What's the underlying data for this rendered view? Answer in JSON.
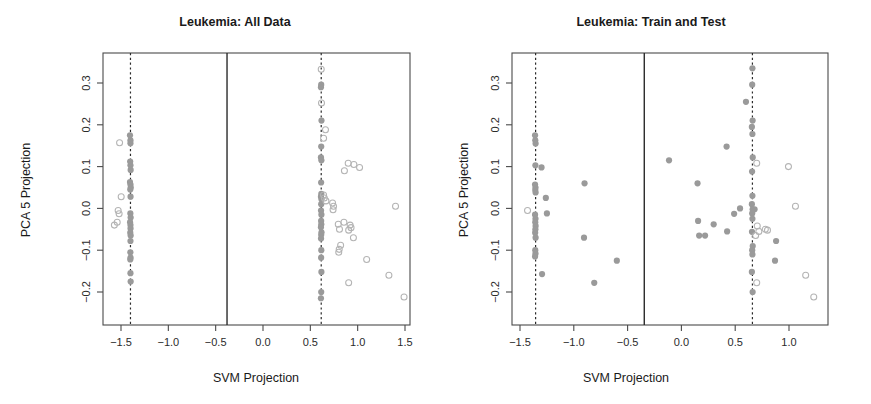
{
  "figure": {
    "width": 871,
    "height": 404,
    "background": "#ffffff",
    "panel_count": 2
  },
  "colors": {
    "filled_point": "#9a9a9a",
    "open_point": "#b4b4b4",
    "axis": "#4a4a4a",
    "rule": "#2b2b2b",
    "text": "#1a1a1a"
  },
  "chart_data": [
    {
      "type": "scatter",
      "panel": "left",
      "title": "Leukemia: All Data",
      "xlabel": "SVM Projection",
      "ylabel": "PCA 5 Projection",
      "xlim": [
        -1.7,
        1.62
      ],
      "ylim": [
        -0.235,
        0.345
      ],
      "xticks": [
        -1.5,
        -1.0,
        -0.5,
        0.0,
        0.5,
        1.0,
        1.5
      ],
      "xticklabels": [
        "-1.5",
        "-1.0",
        "-0.5",
        "0.0",
        "0.5",
        "1.0",
        "1.5"
      ],
      "yticks": [
        0.3,
        0.2,
        0.1,
        0.0,
        -0.1,
        -0.2
      ],
      "yticklabels": [
        "0.3",
        "0.2",
        "0.1",
        "0.0",
        "-0.1",
        "-0.2"
      ],
      "grid": false,
      "legend": "none",
      "vlines": [
        {
          "x": -1.4,
          "style": "dashed",
          "label": "negative-margin"
        },
        {
          "x": -0.38,
          "style": "solid",
          "label": "decision-boundary"
        },
        {
          "x": 0.615,
          "style": "dashed",
          "label": "positive-margin"
        }
      ],
      "series": [
        {
          "name": "support-vectors",
          "marker": "filled-circle",
          "color": "#9a9a9a",
          "points": [
            [
              -1.405,
              0.175
            ],
            [
              -1.4,
              0.163
            ],
            [
              -1.4,
              0.156
            ],
            [
              -1.403,
              0.112
            ],
            [
              -1.4,
              0.103
            ],
            [
              -1.398,
              0.092
            ],
            [
              -1.405,
              0.063
            ],
            [
              -1.4,
              0.057
            ],
            [
              -1.397,
              0.05
            ],
            [
              -1.402,
              0.045
            ],
            [
              -1.399,
              0.028
            ],
            [
              -1.401,
              -0.012
            ],
            [
              -1.398,
              -0.022
            ],
            [
              -1.404,
              -0.033
            ],
            [
              -1.4,
              -0.04
            ],
            [
              -1.399,
              -0.048
            ],
            [
              -1.402,
              -0.058
            ],
            [
              -1.398,
              -0.065
            ],
            [
              -1.4,
              -0.078
            ],
            [
              -1.401,
              -0.105
            ],
            [
              -1.399,
              -0.118
            ],
            [
              -1.402,
              -0.122
            ],
            [
              -1.4,
              -0.155
            ],
            [
              -1.398,
              -0.175
            ],
            [
              0.615,
              0.296
            ],
            [
              0.612,
              0.29
            ],
            [
              0.618,
              0.21
            ],
            [
              0.615,
              0.148
            ],
            [
              0.612,
              0.122
            ],
            [
              0.617,
              0.115
            ],
            [
              0.614,
              0.062
            ],
            [
              0.616,
              0.035
            ],
            [
              0.612,
              0.028
            ],
            [
              0.618,
              0.022
            ],
            [
              0.615,
              0.01
            ],
            [
              0.613,
              -0.005
            ],
            [
              0.617,
              -0.015
            ],
            [
              0.614,
              -0.03
            ],
            [
              0.616,
              -0.038
            ],
            [
              0.612,
              -0.045
            ],
            [
              0.618,
              -0.057
            ],
            [
              0.615,
              -0.063
            ],
            [
              0.613,
              -0.072
            ],
            [
              0.616,
              -0.1
            ],
            [
              0.614,
              -0.118
            ],
            [
              0.617,
              -0.152
            ],
            [
              0.615,
              -0.2
            ],
            [
              0.612,
              -0.215
            ]
          ]
        },
        {
          "name": "non-support-vectors",
          "marker": "open-circle",
          "color": "#b4b4b4",
          "points": [
            [
              -1.515,
              0.157
            ],
            [
              -1.53,
              -0.005
            ],
            [
              -1.52,
              -0.013
            ],
            [
              -1.54,
              -0.033
            ],
            [
              -1.57,
              -0.04
            ],
            [
              -1.498,
              0.028
            ],
            [
              0.615,
              0.333
            ],
            [
              0.618,
              0.252
            ],
            [
              0.66,
              0.188
            ],
            [
              0.64,
              0.168
            ],
            [
              0.64,
              0.032
            ],
            [
              0.648,
              0.025
            ],
            [
              0.665,
              0.018
            ],
            [
              0.9,
              0.108
            ],
            [
              0.96,
              0.105
            ],
            [
              1.02,
              0.098
            ],
            [
              0.86,
              0.09
            ],
            [
              0.735,
              0.013
            ],
            [
              0.745,
              0.005
            ],
            [
              0.74,
              -0.003
            ],
            [
              0.855,
              -0.033
            ],
            [
              0.92,
              -0.04
            ],
            [
              0.93,
              -0.046
            ],
            [
              0.905,
              -0.052
            ],
            [
              0.795,
              -0.038
            ],
            [
              0.808,
              -0.05
            ],
            [
              0.955,
              -0.07
            ],
            [
              0.82,
              -0.088
            ],
            [
              0.805,
              -0.098
            ],
            [
              0.8,
              -0.105
            ],
            [
              1.095,
              -0.122
            ],
            [
              1.4,
              0.005
            ],
            [
              0.905,
              -0.178
            ],
            [
              1.33,
              -0.16
            ],
            [
              1.49,
              -0.212
            ]
          ]
        }
      ]
    },
    {
      "type": "scatter",
      "panel": "right",
      "title": "Leukemia: Train and Test",
      "xlabel": "SVM Projection",
      "ylabel": "PCA 5 Projection",
      "xlim": [
        -1.63,
        1.3
      ],
      "ylim": [
        -0.235,
        0.345
      ],
      "xticks": [
        -1.5,
        -1.0,
        -0.5,
        0.0,
        0.5,
        1.0
      ],
      "xticklabels": [
        "-1.5",
        "-1.0",
        "-0.5",
        "0.0",
        "0.5",
        "1.0"
      ],
      "yticks": [
        0.3,
        0.2,
        0.1,
        0.0,
        -0.1,
        -0.2
      ],
      "yticklabels": [
        "0.3",
        "0.2",
        "0.1",
        "0.0",
        "-0.1",
        "-0.2"
      ],
      "grid": false,
      "legend": "none",
      "vlines": [
        {
          "x": -1.355,
          "style": "dashed",
          "label": "negative-margin"
        },
        {
          "x": -0.345,
          "style": "solid",
          "label": "decision-boundary"
        },
        {
          "x": 0.66,
          "style": "dashed",
          "label": "positive-margin"
        }
      ],
      "series": [
        {
          "name": "train-points",
          "marker": "filled-circle",
          "color": "#9a9a9a",
          "points": [
            [
              -1.36,
              0.175
            ],
            [
              -1.358,
              0.163
            ],
            [
              -1.355,
              0.155
            ],
            [
              -1.357,
              0.103
            ],
            [
              -1.36,
              0.057
            ],
            [
              -1.356,
              0.05
            ],
            [
              -1.358,
              0.044
            ],
            [
              -1.355,
              0.038
            ],
            [
              -1.36,
              -0.015
            ],
            [
              -1.356,
              -0.025
            ],
            [
              -1.358,
              -0.033
            ],
            [
              -1.355,
              -0.042
            ],
            [
              -1.357,
              -0.05
            ],
            [
              -1.359,
              -0.058
            ],
            [
              -1.355,
              -0.07
            ],
            [
              -1.358,
              -0.1
            ],
            [
              -1.356,
              -0.108
            ],
            [
              -1.36,
              -0.115
            ],
            [
              -1.3,
              0.098
            ],
            [
              -1.26,
              0.025
            ],
            [
              -1.25,
              -0.012
            ],
            [
              -1.295,
              -0.157
            ],
            [
              -0.9,
              0.06
            ],
            [
              -0.905,
              -0.07
            ],
            [
              -0.81,
              -0.178
            ],
            [
              -0.6,
              -0.125
            ],
            [
              -0.115,
              0.115
            ],
            [
              0.15,
              0.06
            ],
            [
              0.155,
              -0.03
            ],
            [
              0.165,
              -0.065
            ],
            [
              0.22,
              -0.065
            ],
            [
              0.3,
              -0.038
            ],
            [
              0.42,
              0.148
            ],
            [
              0.425,
              -0.055
            ],
            [
              0.49,
              -0.013
            ],
            [
              0.545,
              0.0
            ],
            [
              0.6,
              0.255
            ],
            [
              0.66,
              0.335
            ],
            [
              0.658,
              0.296
            ],
            [
              0.662,
              0.21
            ],
            [
              0.655,
              0.195
            ],
            [
              0.66,
              0.178
            ],
            [
              0.663,
              0.122
            ],
            [
              0.657,
              0.088
            ],
            [
              0.66,
              0.03
            ],
            [
              0.655,
              0.01
            ],
            [
              0.662,
              -0.002
            ],
            [
              0.658,
              -0.012
            ],
            [
              0.66,
              -0.025
            ],
            [
              0.656,
              -0.056
            ],
            [
              0.663,
              -0.09
            ],
            [
              0.658,
              -0.1
            ],
            [
              0.66,
              -0.11
            ],
            [
              0.655,
              -0.152
            ],
            [
              0.662,
              -0.2
            ],
            [
              0.68,
              -0.002
            ],
            [
              0.88,
              -0.078
            ],
            [
              0.87,
              -0.125
            ]
          ]
        },
        {
          "name": "test-points",
          "marker": "open-circle",
          "color": "#b4b4b4",
          "points": [
            [
              -1.43,
              -0.005
            ],
            [
              0.7,
              0.108
            ],
            [
              0.995,
              0.1
            ],
            [
              1.06,
              0.005
            ],
            [
              0.705,
              -0.042
            ],
            [
              0.72,
              -0.055
            ],
            [
              0.78,
              -0.05
            ],
            [
              0.8,
              -0.052
            ],
            [
              0.69,
              -0.065
            ],
            [
              0.7,
              -0.178
            ],
            [
              1.155,
              -0.16
            ],
            [
              1.23,
              -0.212
            ]
          ]
        }
      ]
    }
  ]
}
